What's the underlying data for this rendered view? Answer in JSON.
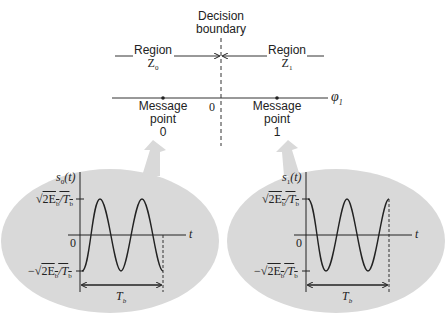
{
  "decision": {
    "boundary_label_line1": "Decision",
    "boundary_label_line2": "boundary"
  },
  "regions": [
    {
      "label": "Region",
      "symbol": "Z",
      "subscript": "0"
    },
    {
      "label": "Region",
      "symbol": "Z",
      "subscript": "1"
    }
  ],
  "axis": {
    "label": "φ",
    "subscript": "1",
    "origin_label": "0"
  },
  "message_points": [
    {
      "line1": "Message",
      "line2": "point",
      "line3": "0"
    },
    {
      "line1": "Message",
      "line2": "point",
      "line3": "1"
    }
  ],
  "waveforms": [
    {
      "ylabel": "s",
      "ylabel_sub": "0",
      "ylabel_arg": "(t)",
      "top_label": "√2E_b/T_b",
      "top_text": "2E",
      "top_sub1": "b",
      "top_mid": "/T",
      "top_sub2": "b",
      "bottom_prefix": "−",
      "origin": "0",
      "xlabel": "t",
      "duration": "T",
      "duration_sub": "b",
      "phase": "starts at minimum (−cos)"
    },
    {
      "ylabel": "s",
      "ylabel_sub": "1",
      "ylabel_arg": "(t)",
      "top_label": "√2E_b/T_b",
      "top_text": "2E",
      "top_sub1": "b",
      "top_mid": "/T",
      "top_sub2": "b",
      "bottom_prefix": "−",
      "origin": "0",
      "xlabel": "t",
      "duration": "T",
      "duration_sub": "b",
      "phase": "starts at maximum (+cos)"
    }
  ],
  "colors": {
    "ink": "#222222",
    "bubble": "#d9d9d9",
    "background": "#ffffff"
  }
}
